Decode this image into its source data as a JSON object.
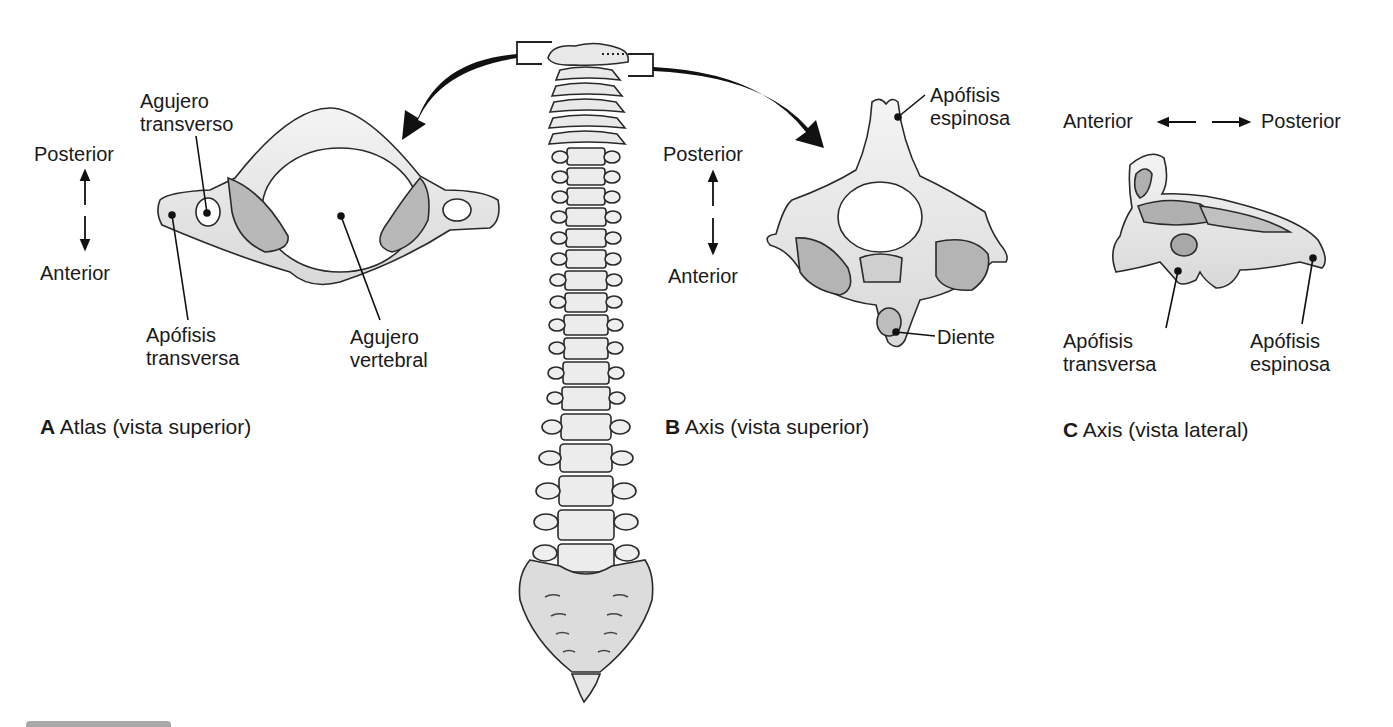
{
  "figure": {
    "panels": [
      {
        "id": "A",
        "letter": "A",
        "title": "Atlas (vista superior)",
        "orientation": {
          "top": "Posterior",
          "bottom": "Anterior"
        },
        "labels": {
          "foramen_transversarium": "Agujero\ntransverso",
          "transverse_process": "Apófisis\ntransversa",
          "vertebral_foramen": "Agujero\nvertebral"
        }
      },
      {
        "id": "B",
        "letter": "B",
        "title": "Axis (vista superior)",
        "orientation": {
          "top": "Posterior",
          "bottom": "Anterior"
        },
        "labels": {
          "spinous_process": "Apófisis\nespinosa",
          "dens": "Diente"
        }
      },
      {
        "id": "C",
        "letter": "C",
        "title": "Axis (vista lateral)",
        "orientation": {
          "left": "Anterior",
          "right": "Posterior"
        },
        "labels": {
          "transverse_process": "Apófisis\ntransversa",
          "spinous_process": "Apófisis\nespinosa"
        }
      }
    ],
    "center_illustration": "vertebral-column",
    "colors": {
      "bone": "#ececec",
      "bone_shade": "#cfcfcf",
      "facet": "#b4b4b4",
      "outline": "#2a2a2a",
      "arrow": "#111111"
    }
  }
}
